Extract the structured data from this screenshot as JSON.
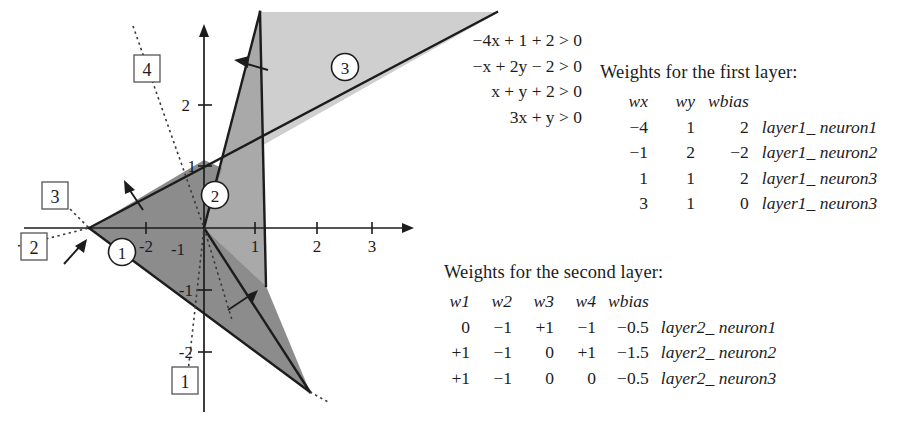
{
  "figure": {
    "axis": {
      "x_ticks": [
        "-2",
        "-1",
        "1",
        "2",
        "3"
      ],
      "y_ticks": [
        "2",
        "1",
        "-1",
        "-2"
      ]
    },
    "region_markers": [
      "1",
      "2",
      "3"
    ],
    "line_labels": [
      "1",
      "2",
      "3",
      "4"
    ],
    "equations": [
      "−4x + 1 + 2 > 0",
      "−x + 2y − 2 > 0",
      "x + y + 2 > 0",
      "3x + y > 0"
    ],
    "colors": {
      "region1": "#8d8d8d",
      "region2": "#a8a8a8",
      "region3": "#cfcfcf",
      "stroke": "#1c1c1c"
    }
  },
  "layer1": {
    "caption": "Weights for the first layer:",
    "headers": [
      "wx",
      "wy",
      "wbias",
      ""
    ],
    "rows": [
      [
        "−4",
        "1",
        "2",
        "layer1_ neuron1"
      ],
      [
        "−1",
        "2",
        "−2",
        "layer1_ neuron2"
      ],
      [
        "1",
        "1",
        "2",
        "layer1_ neuron3"
      ],
      [
        "3",
        "1",
        "0",
        "layer1_ neuron3"
      ]
    ]
  },
  "layer2": {
    "caption": "Weights for the second layer:",
    "headers": [
      "w1",
      "w2",
      "w3",
      "w4",
      "wbias",
      ""
    ],
    "rows": [
      [
        "0",
        "−1",
        "+1",
        "−1",
        "−0.5",
        "layer2_ neuron1"
      ],
      [
        "+1",
        "−1",
        "0",
        "+1",
        "−1.5",
        "layer2_ neuron2"
      ],
      [
        "+1",
        "−1",
        "0",
        "0",
        "−0.5",
        "layer2_ neuron3"
      ]
    ]
  }
}
